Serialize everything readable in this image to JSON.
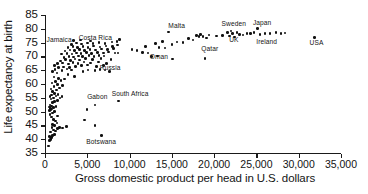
{
  "chart_data": {
    "type": "scatter",
    "title": "",
    "xlabel": "Gross domestic product per head in U.S. dollars",
    "ylabel": "Life expectancy at birth",
    "xlim": [
      0,
      35000
    ],
    "ylim": [
      35,
      85
    ],
    "xticks": [
      0,
      5000,
      10000,
      15000,
      20000,
      25000,
      30000,
      35000
    ],
    "xticklabels": [
      "0",
      "5,000",
      "10,000",
      "15,000",
      "20,000",
      "25,000",
      "30,000",
      "35,000"
    ],
    "yticks": [
      35,
      40,
      45,
      50,
      55,
      60,
      65,
      70,
      75,
      80,
      85
    ],
    "yticklabels": [
      "35",
      "40",
      "45",
      "50",
      "55",
      "60",
      "65",
      "70",
      "75",
      "80",
      "85"
    ],
    "grid": false,
    "legend": null,
    "annotations": [
      {
        "text": "Jamaica",
        "x": 300,
        "y": 75.6
      },
      {
        "text": "Costa Rica",
        "x": 4100,
        "y": 76.2
      },
      {
        "text": "Russia",
        "x": 6600,
        "y": 65.4
      },
      {
        "text": "Gabon",
        "x": 5100,
        "y": 55.0
      },
      {
        "text": "South Africa",
        "x": 8000,
        "y": 56.0
      },
      {
        "text": "Botswana",
        "x": 5000,
        "y": 38.5
      },
      {
        "text": "Oman",
        "x": 12500,
        "y": 69.6
      },
      {
        "text": "Malta",
        "x": 14700,
        "y": 80.8
      },
      {
        "text": "Qatar",
        "x": 18600,
        "y": 72.3
      },
      {
        "text": "Sweden",
        "x": 21000,
        "y": 81.5
      },
      {
        "text": "UK",
        "x": 21900,
        "y": 75.6
      },
      {
        "text": "Japan",
        "x": 24700,
        "y": 81.8
      },
      {
        "text": "Ireland",
        "x": 25100,
        "y": 75.0
      },
      {
        "text": "USA",
        "x": 31400,
        "y": 74.6
      }
    ],
    "points": [
      {
        "x": 380,
        "y": 37.6
      },
      {
        "x": 520,
        "y": 39.5
      },
      {
        "x": 620,
        "y": 39.8
      },
      {
        "x": 700,
        "y": 40.2
      },
      {
        "x": 760,
        "y": 40.6
      },
      {
        "x": 520,
        "y": 41.0
      },
      {
        "x": 900,
        "y": 41.4
      },
      {
        "x": 1100,
        "y": 41.8
      },
      {
        "x": 640,
        "y": 42.6
      },
      {
        "x": 1250,
        "y": 43.0
      },
      {
        "x": 1000,
        "y": 43.4
      },
      {
        "x": 1450,
        "y": 43.8
      },
      {
        "x": 820,
        "y": 44.3
      },
      {
        "x": 1700,
        "y": 44.2
      },
      {
        "x": 1150,
        "y": 44.9
      },
      {
        "x": 900,
        "y": 45.4
      },
      {
        "x": 1400,
        "y": 45.8
      },
      {
        "x": 2100,
        "y": 44.0
      },
      {
        "x": 2550,
        "y": 44.6
      },
      {
        "x": 5900,
        "y": 45.0
      },
      {
        "x": 6700,
        "y": 41.4
      },
      {
        "x": 4700,
        "y": 47.0
      },
      {
        "x": 1250,
        "y": 46.6
      },
      {
        "x": 1000,
        "y": 47.2
      },
      {
        "x": 760,
        "y": 48.0
      },
      {
        "x": 1450,
        "y": 48.4
      },
      {
        "x": 600,
        "y": 49.0
      },
      {
        "x": 900,
        "y": 49.5
      },
      {
        "x": 1150,
        "y": 50.0
      },
      {
        "x": 560,
        "y": 50.4
      },
      {
        "x": 700,
        "y": 50.7
      },
      {
        "x": 800,
        "y": 51.0
      },
      {
        "x": 640,
        "y": 51.2
      },
      {
        "x": 980,
        "y": 51.4
      },
      {
        "x": 520,
        "y": 51.6
      },
      {
        "x": 1300,
        "y": 51.8
      },
      {
        "x": 760,
        "y": 52.1
      },
      {
        "x": 600,
        "y": 52.4
      },
      {
        "x": 4950,
        "y": 50.8
      },
      {
        "x": 5900,
        "y": 52.4
      },
      {
        "x": 8700,
        "y": 53.8
      },
      {
        "x": 900,
        "y": 53.2
      },
      {
        "x": 1150,
        "y": 53.6
      },
      {
        "x": 1500,
        "y": 54.0
      },
      {
        "x": 700,
        "y": 54.5
      },
      {
        "x": 1000,
        "y": 55.0
      },
      {
        "x": 1750,
        "y": 55.0
      },
      {
        "x": 600,
        "y": 55.4
      },
      {
        "x": 1300,
        "y": 55.6
      },
      {
        "x": 2000,
        "y": 55.4
      },
      {
        "x": 800,
        "y": 56.0
      },
      {
        "x": 1550,
        "y": 56.2
      },
      {
        "x": 1100,
        "y": 56.6
      },
      {
        "x": 900,
        "y": 57.2
      },
      {
        "x": 1350,
        "y": 57.8
      },
      {
        "x": 700,
        "y": 58.2
      },
      {
        "x": 1700,
        "y": 58.6
      },
      {
        "x": 1050,
        "y": 59.2
      },
      {
        "x": 1500,
        "y": 59.8
      },
      {
        "x": 2100,
        "y": 59.4
      },
      {
        "x": 850,
        "y": 60.4
      },
      {
        "x": 1250,
        "y": 60.9
      },
      {
        "x": 1900,
        "y": 61.2
      },
      {
        "x": 1600,
        "y": 62.0
      },
      {
        "x": 2300,
        "y": 61.8
      },
      {
        "x": 1050,
        "y": 62.6
      },
      {
        "x": 3500,
        "y": 62.8
      },
      {
        "x": 2700,
        "y": 63.4
      },
      {
        "x": 1400,
        "y": 64.0
      },
      {
        "x": 900,
        "y": 64.6
      },
      {
        "x": 2000,
        "y": 64.9
      },
      {
        "x": 1200,
        "y": 65.2
      },
      {
        "x": 2600,
        "y": 65.4
      },
      {
        "x": 3100,
        "y": 65.0
      },
      {
        "x": 4500,
        "y": 64.6
      },
      {
        "x": 5100,
        "y": 65.0
      },
      {
        "x": 5900,
        "y": 64.8
      },
      {
        "x": 6500,
        "y": 65.2
      },
      {
        "x": 7100,
        "y": 65.0
      },
      {
        "x": 7600,
        "y": 64.6
      },
      {
        "x": 1600,
        "y": 66.0
      },
      {
        "x": 2200,
        "y": 66.2
      },
      {
        "x": 2900,
        "y": 66.0
      },
      {
        "x": 3600,
        "y": 66.4
      },
      {
        "x": 1100,
        "y": 66.8
      },
      {
        "x": 4300,
        "y": 66.6
      },
      {
        "x": 5000,
        "y": 66.9
      },
      {
        "x": 6100,
        "y": 66.4
      },
      {
        "x": 6900,
        "y": 66.8
      },
      {
        "x": 1450,
        "y": 67.4
      },
      {
        "x": 2050,
        "y": 67.6
      },
      {
        "x": 2750,
        "y": 67.2
      },
      {
        "x": 3300,
        "y": 67.8
      },
      {
        "x": 3900,
        "y": 67.4
      },
      {
        "x": 4600,
        "y": 67.9
      },
      {
        "x": 5400,
        "y": 67.6
      },
      {
        "x": 6300,
        "y": 68.0
      },
      {
        "x": 7300,
        "y": 67.5
      },
      {
        "x": 1800,
        "y": 68.4
      },
      {
        "x": 2400,
        "y": 68.8
      },
      {
        "x": 3000,
        "y": 68.6
      },
      {
        "x": 3550,
        "y": 69.0
      },
      {
        "x": 4100,
        "y": 68.7
      },
      {
        "x": 4800,
        "y": 69.2
      },
      {
        "x": 5600,
        "y": 68.9
      },
      {
        "x": 6600,
        "y": 69.3
      },
      {
        "x": 7800,
        "y": 68.8
      },
      {
        "x": 2250,
        "y": 69.7
      },
      {
        "x": 2850,
        "y": 70.0
      },
      {
        "x": 3400,
        "y": 69.8
      },
      {
        "x": 3950,
        "y": 70.2
      },
      {
        "x": 4400,
        "y": 69.9
      },
      {
        "x": 5200,
        "y": 70.3
      },
      {
        "x": 5800,
        "y": 70.0
      },
      {
        "x": 6400,
        "y": 70.4
      },
      {
        "x": 7000,
        "y": 70.1
      },
      {
        "x": 1950,
        "y": 70.8
      },
      {
        "x": 2600,
        "y": 71.0
      },
      {
        "x": 3200,
        "y": 70.9
      },
      {
        "x": 3750,
        "y": 71.3
      },
      {
        "x": 4250,
        "y": 71.0
      },
      {
        "x": 4900,
        "y": 71.4
      },
      {
        "x": 5500,
        "y": 71.1
      },
      {
        "x": 6200,
        "y": 71.5
      },
      {
        "x": 6900,
        "y": 71.2
      },
      {
        "x": 7500,
        "y": 71.6
      },
      {
        "x": 8300,
        "y": 71.3
      },
      {
        "x": 2350,
        "y": 72.0
      },
      {
        "x": 2950,
        "y": 72.3
      },
      {
        "x": 3500,
        "y": 72.1
      },
      {
        "x": 4050,
        "y": 72.5
      },
      {
        "x": 4650,
        "y": 72.2
      },
      {
        "x": 5300,
        "y": 72.6
      },
      {
        "x": 6000,
        "y": 72.3
      },
      {
        "x": 6700,
        "y": 72.7
      },
      {
        "x": 7400,
        "y": 72.4
      },
      {
        "x": 8100,
        "y": 72.8
      },
      {
        "x": 2700,
        "y": 73.2
      },
      {
        "x": 3300,
        "y": 73.5
      },
      {
        "x": 3850,
        "y": 73.2
      },
      {
        "x": 4500,
        "y": 73.6
      },
      {
        "x": 5100,
        "y": 73.3
      },
      {
        "x": 5750,
        "y": 73.7
      },
      {
        "x": 6500,
        "y": 73.4
      },
      {
        "x": 7200,
        "y": 73.8
      },
      {
        "x": 8000,
        "y": 73.5
      },
      {
        "x": 8600,
        "y": 74.2
      },
      {
        "x": 3100,
        "y": 74.4
      },
      {
        "x": 3700,
        "y": 74.8
      },
      {
        "x": 4350,
        "y": 74.5
      },
      {
        "x": 5000,
        "y": 74.9
      },
      {
        "x": 5700,
        "y": 74.6
      },
      {
        "x": 6400,
        "y": 75.0
      },
      {
        "x": 7100,
        "y": 74.7
      },
      {
        "x": 7900,
        "y": 75.2
      },
      {
        "x": 8500,
        "y": 75.4
      },
      {
        "x": 3400,
        "y": 75.8
      },
      {
        "x": 4200,
        "y": 76.0
      },
      {
        "x": 5400,
        "y": 75.6
      },
      {
        "x": 8800,
        "y": 76.2
      },
      {
        "x": 8650,
        "y": 71.2
      },
      {
        "x": 10300,
        "y": 72.6
      },
      {
        "x": 10900,
        "y": 72.2
      },
      {
        "x": 11500,
        "y": 71.5
      },
      {
        "x": 11900,
        "y": 73.6
      },
      {
        "x": 12200,
        "y": 71.2
      },
      {
        "x": 12600,
        "y": 70.0
      },
      {
        "x": 13100,
        "y": 74.6
      },
      {
        "x": 13500,
        "y": 73.2
      },
      {
        "x": 13300,
        "y": 70.2
      },
      {
        "x": 13900,
        "y": 75.4
      },
      {
        "x": 14200,
        "y": 73.0
      },
      {
        "x": 14600,
        "y": 78.8
      },
      {
        "x": 15000,
        "y": 74.4
      },
      {
        "x": 15100,
        "y": 69.0
      },
      {
        "x": 15600,
        "y": 75.2
      },
      {
        "x": 16300,
        "y": 75.0
      },
      {
        "x": 17000,
        "y": 76.4
      },
      {
        "x": 17500,
        "y": 76.0
      },
      {
        "x": 17900,
        "y": 77.6
      },
      {
        "x": 18200,
        "y": 77.2
      },
      {
        "x": 18400,
        "y": 78.0
      },
      {
        "x": 18700,
        "y": 77.3
      },
      {
        "x": 18900,
        "y": 69.3
      },
      {
        "x": 19100,
        "y": 76.6
      },
      {
        "x": 19400,
        "y": 77.8
      },
      {
        "x": 20300,
        "y": 77.4
      },
      {
        "x": 21000,
        "y": 77.6
      },
      {
        "x": 21600,
        "y": 78.6
      },
      {
        "x": 21800,
        "y": 77.4
      },
      {
        "x": 22000,
        "y": 79.2
      },
      {
        "x": 22200,
        "y": 78.2
      },
      {
        "x": 22400,
        "y": 77.0
      },
      {
        "x": 22700,
        "y": 78.6
      },
      {
        "x": 23000,
        "y": 78.0
      },
      {
        "x": 23400,
        "y": 77.8
      },
      {
        "x": 23900,
        "y": 78.4
      },
      {
        "x": 24300,
        "y": 78.2
      },
      {
        "x": 24700,
        "y": 78.6
      },
      {
        "x": 25100,
        "y": 80.2
      },
      {
        "x": 25400,
        "y": 78.0
      },
      {
        "x": 26000,
        "y": 78.4
      },
      {
        "x": 26600,
        "y": 78.2
      },
      {
        "x": 27300,
        "y": 78.6
      },
      {
        "x": 27900,
        "y": 78.4
      },
      {
        "x": 28400,
        "y": 78.5
      },
      {
        "x": 31900,
        "y": 76.9
      }
    ]
  }
}
